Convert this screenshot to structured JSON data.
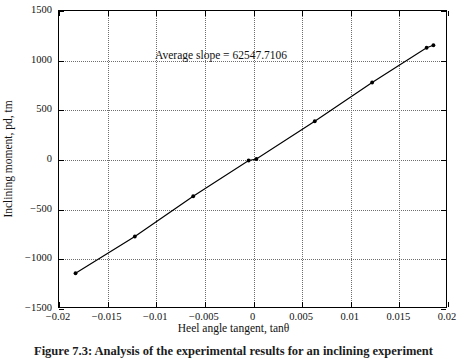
{
  "figure": {
    "caption": "Figure 7.3: Analysis of the experimental results for an inclining experiment"
  },
  "chart_data": {
    "type": "scatter",
    "title": "",
    "xlabel": "Heel angle tangent, tanθ",
    "ylabel": "Inclining moment, pd, tm",
    "annotation": "Average slope = 62547.7106",
    "slope": 62547.7106,
    "grid": true,
    "legend": "none",
    "xlim": [
      -0.02,
      0.02
    ],
    "ylim": [
      -1500,
      1500
    ],
    "xticks": [
      -0.02,
      -0.015,
      -0.01,
      -0.005,
      0,
      0.005,
      0.01,
      0.015,
      0.02
    ],
    "xticklabels": [
      "−0.02",
      "−0.015",
      "−0.01",
      "−0.005",
      "0",
      "0.005",
      "0.01",
      "0.015",
      "0.02"
    ],
    "yticks": [
      -1500,
      -1000,
      -500,
      0,
      500,
      1000,
      1500
    ],
    "yticklabels": [
      "−1500",
      "−1000",
      "−500",
      "0",
      "500",
      "1000",
      "1500"
    ],
    "series": [
      {
        "name": "Inclining moment vs heel tangent",
        "marker": "dot",
        "line": "solid",
        "color": "#000000",
        "x": [
          -0.0183,
          -0.0122,
          -0.0062,
          -0.0005,
          0.0003,
          0.0063,
          0.0122,
          0.0178,
          0.0185
        ],
        "y": [
          -1140,
          -770,
          -365,
          -5,
          10,
          390,
          780,
          1130,
          1155
        ]
      }
    ]
  }
}
